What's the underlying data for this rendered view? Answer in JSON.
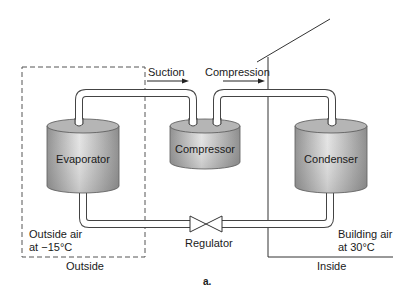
{
  "diagram": {
    "type": "heat-pump refrigeration cycle",
    "components": [
      {
        "id": "evaporator",
        "label": "Evaporator"
      },
      {
        "id": "compressor",
        "label": "Compressor"
      },
      {
        "id": "condenser",
        "label": "Condenser"
      },
      {
        "id": "regulator",
        "label": "Regulator"
      }
    ],
    "flows": [
      {
        "label": "Suction",
        "from": "evaporator",
        "to": "compressor"
      },
      {
        "label": "Compression",
        "from": "compressor",
        "to": "condenser"
      }
    ],
    "zones": {
      "outside": {
        "label": "Outside",
        "condition_line1": "Outside air",
        "condition_line2": "at −15°C"
      },
      "inside": {
        "label": "Inside",
        "condition_line1": "Building air",
        "condition_line2": "at 30°C"
      }
    },
    "figure_label": "a.",
    "colors": {
      "tank_dark": "#8c8c8c",
      "tank_light": "#e6e6e6",
      "tank_top": "#b3b3b3",
      "line": "#333333",
      "dashed": "#555555"
    }
  }
}
